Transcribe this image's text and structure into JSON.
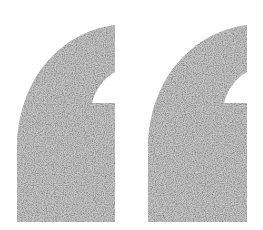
{
  "icon": {
    "name": "opening-double-quotation-mark",
    "glyph": "“",
    "fill_color": "#c6c6c6",
    "background_color": "#ffffff",
    "texture": "speckled-noise"
  }
}
